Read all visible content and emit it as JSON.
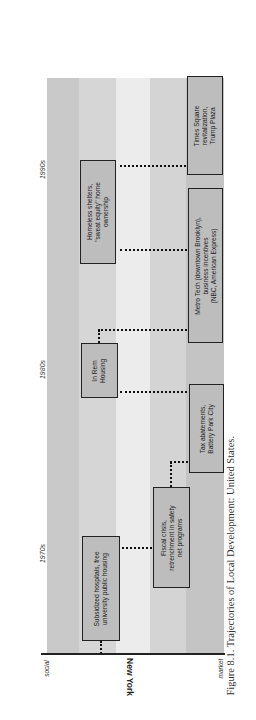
{
  "figure": {
    "caption": "Figure 8.1. Trajectories of Local Development: United States.",
    "city_label": "New York",
    "axis": {
      "left_label": "social",
      "right_label": "market"
    },
    "decades": [
      {
        "label": "1970s"
      },
      {
        "label": "1980s"
      },
      {
        "label": "1990s"
      }
    ],
    "band_colors": [
      "#c9c9c9",
      "#d6d6d6",
      "#ececec",
      "#d4d4d4",
      "#c4c4c4"
    ],
    "events": [
      {
        "id": "subsidized",
        "text": "Subsidized hospitals, free\nuniversity public housing",
        "decade": "1970s"
      },
      {
        "id": "fiscal",
        "text": "Fiscal crisis,\nretrenchment in safety\nnet programs",
        "decade": "1970s"
      },
      {
        "id": "tax",
        "text": "Tax abatements,\nBattery Park City",
        "decade": "1980s"
      },
      {
        "id": "inrem",
        "text": "In Rem\nHousing",
        "decade": "1980s"
      },
      {
        "id": "metrotech",
        "text": "Metro Tech (downtown Brooklyn),\nbusiness incentives\n(NBC, American Express)",
        "decade": "1980s-1990s"
      },
      {
        "id": "homeless",
        "text": "Homeless shelters,\n\"sweat equity\" home\nownership",
        "decade": "1990s"
      },
      {
        "id": "timessq",
        "text": "Times Square\nrevitalization,\nTrump Plaza",
        "decade": "1990s"
      }
    ]
  }
}
